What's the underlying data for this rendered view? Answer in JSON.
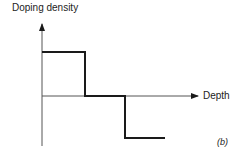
{
  "diagram": {
    "y_axis_label": "Doping density",
    "x_axis_label": "Depth",
    "panel_label": "(b)",
    "profile": "step doping profile: positive region, zero region, negative region",
    "line_color": "#1a1a1a"
  }
}
